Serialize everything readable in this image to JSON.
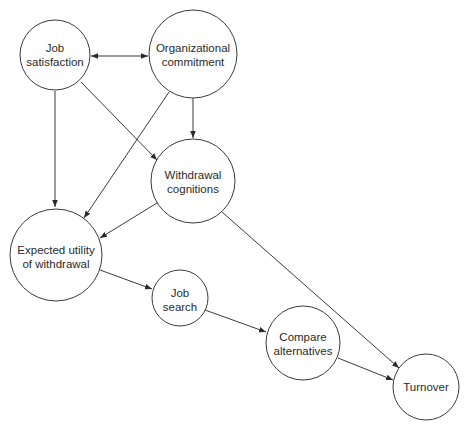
{
  "diagram": {
    "nodes": [
      {
        "id": "job-satisfaction",
        "lines": [
          "Job",
          "satisfaction"
        ]
      },
      {
        "id": "organizational-commitment",
        "lines": [
          "Organizational",
          "commitment"
        ]
      },
      {
        "id": "withdrawal-cognitions",
        "lines": [
          "Withdrawal",
          "cognitions"
        ]
      },
      {
        "id": "expected-utility",
        "lines": [
          "Expected utility",
          "of withdrawal"
        ]
      },
      {
        "id": "job-search",
        "lines": [
          "Job",
          "search"
        ]
      },
      {
        "id": "compare-alternatives",
        "lines": [
          "Compare",
          "alternatives"
        ]
      },
      {
        "id": "turnover",
        "lines": [
          "Turnover"
        ]
      }
    ],
    "edges": [
      {
        "from": "job-satisfaction",
        "to": "organizational-commitment",
        "bidirectional": true
      },
      {
        "from": "job-satisfaction",
        "to": "withdrawal-cognitions"
      },
      {
        "from": "job-satisfaction",
        "to": "expected-utility"
      },
      {
        "from": "organizational-commitment",
        "to": "withdrawal-cognitions"
      },
      {
        "from": "organizational-commitment",
        "to": "expected-utility"
      },
      {
        "from": "withdrawal-cognitions",
        "to": "expected-utility"
      },
      {
        "from": "withdrawal-cognitions",
        "to": "turnover"
      },
      {
        "from": "expected-utility",
        "to": "job-search"
      },
      {
        "from": "job-search",
        "to": "compare-alternatives"
      },
      {
        "from": "compare-alternatives",
        "to": "turnover"
      }
    ]
  }
}
